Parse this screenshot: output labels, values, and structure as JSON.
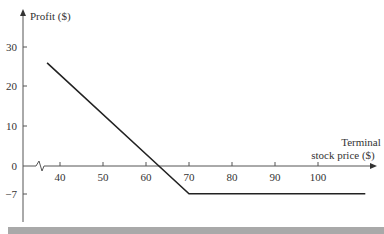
{
  "chart_data": {
    "type": "line",
    "title": "",
    "ylabel": "Profit ($)",
    "xlabel": "Terminal stock price ($)",
    "xlabel_lines": [
      "Terminal",
      "stock price ($)"
    ],
    "x_ticks": [
      40,
      50,
      60,
      70,
      80,
      90,
      100
    ],
    "x_tick_labels": [
      "40",
      "50",
      "60",
      "70",
      "80",
      "90",
      "100"
    ],
    "y_ticks": [
      30,
      20,
      10,
      0,
      -7
    ],
    "y_tick_labels": [
      "30",
      "20",
      "10",
      "0",
      "−7"
    ],
    "xlim": [
      31,
      115
    ],
    "ylim": [
      -13,
      35
    ],
    "axis_break": "x-axis break near 35",
    "grid": false,
    "legend": null,
    "series": [
      {
        "name": "Profit",
        "x": [
          37,
          63,
          70,
          111
        ],
        "y": [
          26,
          0,
          -7,
          -7
        ],
        "color": "#222222"
      }
    ],
    "annotations": {
      "breakeven_price": 63,
      "max_loss": -7,
      "strike": 70
    }
  },
  "colors": {
    "line": "#222222",
    "axis": "#555555",
    "bottom_bar": "#a9a9a9"
  }
}
